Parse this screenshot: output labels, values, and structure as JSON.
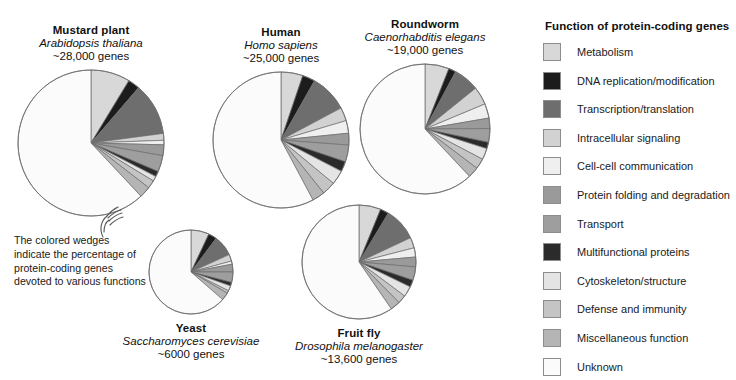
{
  "legend": {
    "title": "Function of protein-coding genes",
    "items": [
      {
        "label": "Metabolism",
        "color": "#d8d8d8"
      },
      {
        "label": "DNA replication/modification",
        "color": "#1c1c1c"
      },
      {
        "label": "Transcription/translation",
        "color": "#6e6e6e"
      },
      {
        "label": "Intracellular signaling",
        "color": "#d2d2d2"
      },
      {
        "label": "Cell-cell communication",
        "color": "#efefef"
      },
      {
        "label": "Protein folding and degradation",
        "color": "#9a9a9a"
      },
      {
        "label": "Transport",
        "color": "#9e9e9e"
      },
      {
        "label": "Multifunctional proteins",
        "color": "#2b2b2b"
      },
      {
        "label": "Cytoskeleton/structure",
        "color": "#e4e4e4"
      },
      {
        "label": "Defense and immunity",
        "color": "#c4c4c4"
      },
      {
        "label": "Miscellaneous function",
        "color": "#b5b5b5"
      },
      {
        "label": "Unknown",
        "color": "#fbfbfb"
      }
    ]
  },
  "annotation": {
    "text": "The colored wedges indicate the percentage of protein-coding genes devoted to various functions"
  },
  "chart_data": {
    "type": "pie",
    "title": "Function of protein-coding genes",
    "legend_position": "right",
    "categories": [
      "Metabolism",
      "DNA replication/modification",
      "Transcription/translation",
      "Intracellular signaling",
      "Cell-cell communication",
      "Protein folding and degradation",
      "Transport",
      "Multifunctional proteins",
      "Cytoskeleton/structure",
      "Defense and immunity",
      "Miscellaneous function",
      "Unknown"
    ],
    "colors": [
      "#d8d8d8",
      "#1c1c1c",
      "#6e6e6e",
      "#d2d2d2",
      "#efefef",
      "#9a9a9a",
      "#9e9e9e",
      "#2b2b2b",
      "#e4e4e4",
      "#c4c4c4",
      "#b5b5b5",
      "#fbfbfb"
    ],
    "charts": [
      {
        "id": "mustard-plant",
        "common_name": "Mustard plant",
        "scientific_name": "Arabidopsis thaliana",
        "gene_count": "~28,000 genes",
        "cx": 91,
        "cy": 143,
        "r": 73,
        "values": [
          8.7,
          2.6,
          11.6,
          1.5,
          1.0,
          2.4,
          3.6,
          1.2,
          1.1,
          1.8,
          2.5,
          62.0
        ]
      },
      {
        "id": "human",
        "common_name": "Human",
        "scientific_name": "Homo sapiens",
        "gene_count": "~25,000 genes",
        "cx": 281,
        "cy": 140,
        "r": 68,
        "values": [
          5.2,
          3.0,
          9.0,
          3.2,
          3.0,
          2.8,
          4.0,
          2.4,
          3.4,
          3.2,
          3.0,
          57.8
        ]
      },
      {
        "id": "roundworm",
        "common_name": "Roundworm",
        "scientific_name": "Caenorhabditis elegans",
        "gene_count": "~19,000 genes",
        "cx": 425,
        "cy": 129,
        "r": 65,
        "values": [
          6.0,
          1.8,
          6.4,
          4.5,
          3.6,
          2.6,
          3.4,
          1.6,
          2.8,
          2.6,
          2.7,
          62.0
        ]
      },
      {
        "id": "yeast",
        "common_name": "Yeast",
        "scientific_name": "Saccharomyces cerevisiae",
        "gene_count": "~6000 genes",
        "cx": 191,
        "cy": 272,
        "r": 42,
        "values": [
          7.0,
          3.2,
          8.0,
          2.6,
          1.2,
          3.0,
          4.0,
          1.4,
          2.0,
          1.0,
          3.0,
          63.6
        ]
      },
      {
        "id": "fruit-fly",
        "common_name": "Fruit fly",
        "scientific_name": "Drosophila melanogaster",
        "gene_count": "~13,600 genes",
        "cx": 359,
        "cy": 262,
        "r": 57,
        "values": [
          6.2,
          2.4,
          9.4,
          3.0,
          2.6,
          2.8,
          3.8,
          2.0,
          3.0,
          2.4,
          2.8,
          59.6
        ]
      }
    ]
  }
}
